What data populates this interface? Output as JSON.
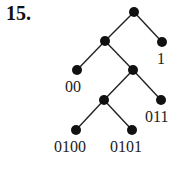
{
  "problem_number": "15.",
  "tree": {
    "nodes": [
      {
        "id": "root",
        "x": 134,
        "y": 12
      },
      {
        "id": "0",
        "x": 105,
        "y": 41
      },
      {
        "id": "1",
        "x": 162,
        "y": 42,
        "label": "1"
      },
      {
        "id": "00",
        "x": 77,
        "y": 70,
        "label": "00"
      },
      {
        "id": "01",
        "x": 133,
        "y": 70
      },
      {
        "id": "010",
        "x": 104,
        "y": 100
      },
      {
        "id": "011",
        "x": 161,
        "y": 100,
        "label": "011"
      },
      {
        "id": "0100",
        "x": 76,
        "y": 130,
        "label": "0100"
      },
      {
        "id": "0101",
        "x": 132,
        "y": 130,
        "label": "0101"
      }
    ],
    "edges": [
      [
        "root",
        "0"
      ],
      [
        "root",
        "1"
      ],
      [
        "0",
        "00"
      ],
      [
        "0",
        "01"
      ],
      [
        "01",
        "010"
      ],
      [
        "01",
        "011"
      ],
      [
        "010",
        "0100"
      ],
      [
        "010",
        "0101"
      ]
    ]
  },
  "labels": {
    "l1": "1",
    "l00": "00",
    "l011": "011",
    "l0100": "0100",
    "l0101": "0101"
  }
}
